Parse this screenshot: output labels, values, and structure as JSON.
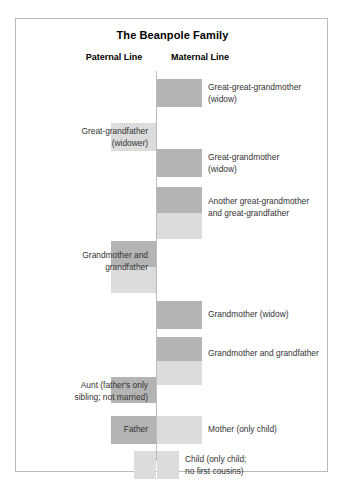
{
  "title": "The Beanpole Family",
  "columns": {
    "paternal": "Paternal Line",
    "maternal": "Maternal Line"
  },
  "colors": {
    "female": "#b4b4b4",
    "male": "#dcdcdc",
    "spine": "#bdbdbd",
    "border": "#b9b9b9",
    "text": "#333333",
    "background": "#ffffff"
  },
  "legend": {
    "female_shade": "dark gray",
    "male_shade": "light gray"
  },
  "generations": [
    {
      "id": "great-great-grandparents",
      "side": "maternal",
      "label": "Great-great-grandmother\n(widow)",
      "blocks": [
        {
          "sex": "female",
          "side": "right",
          "top": 60,
          "height": 28,
          "width": 45
        }
      ],
      "label_x": 192,
      "label_y": 63
    },
    {
      "id": "great-grandfather-paternal",
      "side": "paternal",
      "label": "Great-grandfather\n(widower)",
      "blocks": [
        {
          "sex": "male",
          "side": "left",
          "top": 104,
          "height": 28,
          "width": 45
        }
      ],
      "label_x": 18,
      "label_y": 107
    },
    {
      "id": "great-grandmother-maternal",
      "side": "maternal",
      "label": "Great-grandmother\n(widow)",
      "blocks": [
        {
          "sex": "female",
          "side": "right",
          "top": 130,
          "height": 28,
          "width": 45
        }
      ],
      "label_x": 192,
      "label_y": 133
    },
    {
      "id": "another-great-grandparents",
      "side": "maternal",
      "label": "Another great-grandmother\nand great-grandfather",
      "blocks": [
        {
          "sex": "female",
          "side": "right",
          "top": 168,
          "height": 26,
          "width": 45
        },
        {
          "sex": "male",
          "side": "right",
          "top": 194,
          "height": 26,
          "width": 45
        }
      ],
      "label_x": 192,
      "label_y": 177
    },
    {
      "id": "grandparents-paternal",
      "side": "paternal",
      "label": "Grandmother and\ngrandfather",
      "blocks": [
        {
          "sex": "female",
          "side": "left",
          "top": 222,
          "height": 26,
          "width": 45
        },
        {
          "sex": "male",
          "side": "left",
          "top": 248,
          "height": 26,
          "width": 45
        }
      ],
      "label_x": 18,
      "label_y": 231
    },
    {
      "id": "grandmother-maternal-widow",
      "side": "maternal",
      "label": "Grandmother (widow)",
      "blocks": [
        {
          "sex": "female",
          "side": "right",
          "top": 282,
          "height": 28,
          "width": 45
        }
      ],
      "label_x": 192,
      "label_y": 290
    },
    {
      "id": "grandparents-maternal",
      "side": "maternal",
      "label": "Grandmother and grandfather",
      "blocks": [
        {
          "sex": "female",
          "side": "right",
          "top": 318,
          "height": 24,
          "width": 45
        },
        {
          "sex": "male",
          "side": "right",
          "top": 342,
          "height": 24,
          "width": 45
        }
      ],
      "label_x": 192,
      "label_y": 329
    },
    {
      "id": "aunt",
      "side": "paternal",
      "label": "Aunt (father's only\nsibling; not married)",
      "blocks": [
        {
          "sex": "female",
          "side": "left",
          "top": 358,
          "height": 26,
          "width": 45
        }
      ],
      "label_x": 18,
      "label_y": 361
    },
    {
      "id": "parents",
      "side": "both",
      "label_left": "Father",
      "label_right": "Mother (only child)",
      "blocks": [
        {
          "sex": "female",
          "side": "left",
          "top": 397,
          "height": 28,
          "width": 45
        },
        {
          "sex": "male",
          "side": "right",
          "top": 397,
          "height": 28,
          "width": 45
        }
      ],
      "label_left_x": 18,
      "label_left_y": 405,
      "label_right_x": 192,
      "label_right_y": 405
    },
    {
      "id": "child",
      "side": "both",
      "label": "Child (only child;\nno first cousins)",
      "blocks": [
        {
          "sex": "male",
          "side": "left",
          "top": 432,
          "height": 28,
          "width": 22
        },
        {
          "sex": "male",
          "side": "right",
          "top": 432,
          "height": 28,
          "width": 22
        }
      ],
      "label_x": 169,
      "label_y": 435
    }
  ]
}
